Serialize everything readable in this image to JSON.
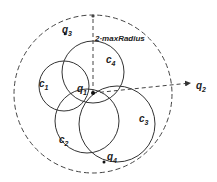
{
  "diagram": {
    "outer_circle": {
      "cx": 93,
      "cy": 94,
      "r": 79,
      "style": "dashed"
    },
    "circles": [
      {
        "id": "c1",
        "label": "c",
        "sub": "1",
        "cx": 64,
        "cy": 86,
        "r": 25,
        "lx": 40,
        "ly": 86
      },
      {
        "id": "c2",
        "label": "c",
        "sub": "2",
        "cx": 87,
        "cy": 121,
        "r": 32,
        "lx": 59,
        "ly": 143
      },
      {
        "id": "c3",
        "label": "c",
        "sub": "3",
        "cx": 117,
        "cy": 124,
        "r": 38,
        "lx": 140,
        "ly": 122
      },
      {
        "id": "c4",
        "label": "c",
        "sub": "4",
        "cx": 93,
        "cy": 72,
        "r": 31,
        "lx": 108,
        "ly": 64
      }
    ],
    "points": [
      {
        "id": "q1",
        "label": "q",
        "sub": "1",
        "x": 93,
        "y": 93,
        "lx": 78,
        "ly": 92
      },
      {
        "id": "q2",
        "label": "q",
        "sub": "2",
        "x": 193,
        "y": 83,
        "lx": 197,
        "ly": 89
      },
      {
        "id": "q3",
        "label": "q",
        "sub": "3",
        "x": 65,
        "y": 34,
        "lx": 62,
        "ly": 32
      },
      {
        "id": "q4",
        "label": "q",
        "sub": "4",
        "x": 104,
        "y": 162,
        "lx": 107,
        "ly": 160
      }
    ],
    "radius_label": "2·maxRadius",
    "colors": {
      "stroke": "#333333",
      "text": "#222222",
      "background": "#ffffff"
    }
  }
}
